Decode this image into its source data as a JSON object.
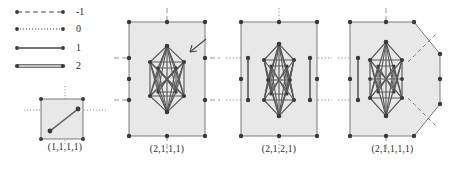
{
  "figure": {
    "type": "math-diagram",
    "background_color": "#ffffff",
    "ink_color": "#3a3a3a",
    "fill_color": "#e8e8e8",
    "vertex_color": "#4a4a4a"
  },
  "legend": {
    "name": "edge-multiplicity-legend",
    "rows": [
      {
        "label": "-1",
        "style": "dashed",
        "width": 1.1
      },
      {
        "label": "0",
        "style": "dotted",
        "width": 1.1
      },
      {
        "label": "1",
        "style": "solid",
        "width": 1.3
      },
      {
        "label": "2",
        "style": "solid-thick",
        "width": 3.2
      }
    ]
  },
  "panels": [
    {
      "name": "panel-1",
      "caption": "(1,1,1,1)",
      "shape": "square",
      "vertices": 6,
      "edges_visible": 1
    },
    {
      "name": "panel-2",
      "caption": "(2,1,1,1)",
      "shape": "rectangle",
      "has_arrow_annotation": true,
      "side_segments": 0
    },
    {
      "name": "panel-3",
      "caption": "(2,1,2,1)",
      "shape": "rectangle",
      "has_arrow_annotation": false,
      "side_segments": 2
    },
    {
      "name": "panel-4",
      "caption": "(2,1,1,1,1)",
      "shape": "hexagon",
      "has_arrow_annotation": false,
      "side_segments": 1,
      "diagonal_dashed_rays": 2
    }
  ]
}
